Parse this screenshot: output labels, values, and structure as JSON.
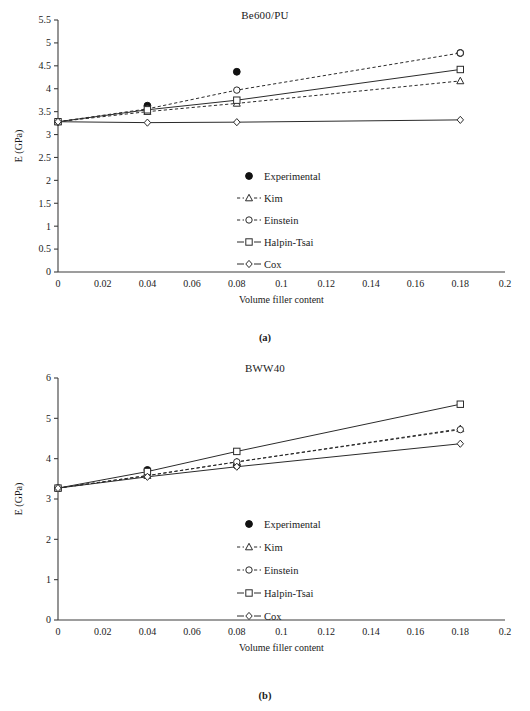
{
  "figure": {
    "panels": [
      {
        "caption": "(a)",
        "chart_data": {
          "type": "line",
          "title": "Be600/PU",
          "xlabel": "Volume filler content",
          "ylabel": "E (GPa)",
          "xlim": [
            0,
            0.2
          ],
          "ylim": [
            0,
            5.5
          ],
          "xticks": [
            "0",
            "0.02",
            "0.04",
            "0.06",
            "0.08",
            "0.1",
            "0.12",
            "0.14",
            "0.16",
            "0.18",
            "0.2"
          ],
          "xtick_values": [
            0,
            0.02,
            0.04,
            0.06,
            0.08,
            0.1,
            0.12,
            0.14,
            0.16,
            0.18,
            0.2
          ],
          "yticks": [
            "0",
            "0.5",
            "1",
            "1.5",
            "2",
            "2.5",
            "3",
            "3.5",
            "4",
            "4.5",
            "5",
            "5.5"
          ],
          "ytick_values": [
            0,
            0.5,
            1,
            1.5,
            2,
            2.5,
            3,
            3.5,
            4,
            4.5,
            5,
            5.5
          ],
          "grid": false,
          "legend_position": "center-right",
          "x": [
            0,
            0.04,
            0.08,
            0.18
          ],
          "series": [
            {
              "name": "Experimental",
              "marker": "filled-circle",
              "line": "none",
              "values": [
                3.28,
                3.63,
                4.37,
                4.78
              ]
            },
            {
              "name": "Kim",
              "marker": "triangle",
              "line": "dashed",
              "values": [
                3.28,
                3.5,
                3.68,
                4.17
              ]
            },
            {
              "name": "Einstein",
              "marker": "circle",
              "line": "dashed",
              "values": [
                3.28,
                3.56,
                3.97,
                4.78
              ]
            },
            {
              "name": "Halpin-Tsai",
              "marker": "square",
              "line": "solid",
              "values": [
                3.28,
                3.54,
                3.75,
                4.42
              ]
            },
            {
              "name": "Cox",
              "marker": "diamond",
              "line": "solid",
              "values": [
                3.28,
                3.26,
                3.27,
                3.32
              ]
            }
          ]
        }
      },
      {
        "caption": "(b)",
        "chart_data": {
          "type": "line",
          "title": "BWW40",
          "xlabel": "Volume filler content",
          "ylabel": "E (GPa)",
          "xlim": [
            0,
            0.2
          ],
          "ylim": [
            0,
            6
          ],
          "xticks": [
            "0",
            "0.02",
            "0.04",
            "0.06",
            "0.08",
            "0.1",
            "0.12",
            "0.14",
            "0.16",
            "0.18",
            "0.2"
          ],
          "xtick_values": [
            0,
            0.02,
            0.04,
            0.06,
            0.08,
            0.1,
            0.12,
            0.14,
            0.16,
            0.18,
            0.2
          ],
          "yticks": [
            "0",
            "1",
            "2",
            "3",
            "4",
            "5",
            "6"
          ],
          "ytick_values": [
            0,
            1,
            2,
            3,
            4,
            5,
            6
          ],
          "grid": false,
          "legend_position": "center-right",
          "x": [
            0,
            0.04,
            0.08,
            0.18
          ],
          "series": [
            {
              "name": "Experimental",
              "marker": "filled-circle",
              "line": "none",
              "values": [
                3.27,
                3.72,
                3.83,
                null
              ]
            },
            {
              "name": "Kim",
              "marker": "triangle",
              "line": "dashed",
              "values": [
                3.27,
                3.58,
                3.92,
                4.74
              ]
            },
            {
              "name": "Einstein",
              "marker": "circle",
              "line": "dashed",
              "values": [
                3.27,
                3.58,
                3.92,
                4.72
              ]
            },
            {
              "name": "Halpin-Tsai",
              "marker": "square",
              "line": "solid",
              "values": [
                3.27,
                3.68,
                4.18,
                5.35
              ]
            },
            {
              "name": "Cox",
              "marker": "diamond",
              "line": "solid",
              "values": [
                3.27,
                3.55,
                3.8,
                4.37
              ]
            }
          ]
        }
      }
    ]
  }
}
